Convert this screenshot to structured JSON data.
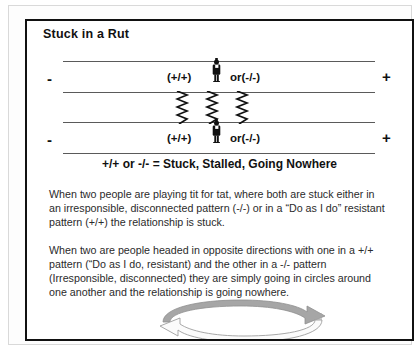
{
  "slide": {
    "title": "Stuck in a Rut",
    "caption": "+/+ or -/- = Stuck, Stalled, Going Nowhere"
  },
  "diagram": {
    "axis_top": {
      "left_sign": "-",
      "right_sign": "+",
      "label_positive": "(+/+)",
      "label_negative": "or(-/-)",
      "figure": "person-icon"
    },
    "axis_bottom": {
      "left_sign": "-",
      "right_sign": "+",
      "label_positive": "(+/+)",
      "label_negative": "or(-/-)",
      "figure": "person-icon"
    },
    "connector": "zigzag-lightning-lines",
    "zigzag_count": 3,
    "loop": "circular-arrow-loop"
  },
  "body": {
    "paragraph_1": "When two people are playing tit for tat, where both are stuck either in an irresponsible, disconnected pattern (-/-) or in a “Do as I do” resistant pattern (+/+) the relationship is stuck.",
    "paragraph_2": "When two are people headed in opposite directions with one in a +/+ pattern (“Do as I do, resistant) and the other in a -/- pattern (Irresponsible, disconnected) they are simply going in circles around one another and the relationship is going nowhere."
  },
  "colors": {
    "ink": "#111111",
    "body_text": "#2b2b2b",
    "rule": "#5a5a5a",
    "loop_gray": "#9e9e9e",
    "frame": "#d9d9d9",
    "page": "#ffffff"
  }
}
